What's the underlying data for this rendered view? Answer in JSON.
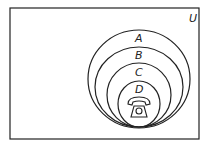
{
  "diagram": {
    "type": "venn-nested",
    "universe_label": "U",
    "sets": [
      {
        "label": "A"
      },
      {
        "label": "B"
      },
      {
        "label": "C"
      },
      {
        "label": "D"
      }
    ],
    "center_icon": "telephone-icon",
    "colors": {
      "stroke": "#222222",
      "background": "#ffffff"
    }
  }
}
